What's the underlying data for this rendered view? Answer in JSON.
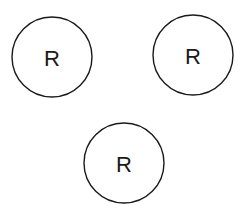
{
  "diagram": {
    "nodes": [
      {
        "id": "left",
        "label": "R",
        "cx": 52,
        "cy": 57,
        "r": 40
      },
      {
        "id": "right",
        "label": "R",
        "cx": 193,
        "cy": 55,
        "r": 40
      },
      {
        "id": "bottom",
        "label": "R",
        "cx": 124,
        "cy": 163,
        "r": 40
      }
    ],
    "colors": {
      "stroke": "#1a1a1a",
      "background": "#ffffff"
    }
  }
}
